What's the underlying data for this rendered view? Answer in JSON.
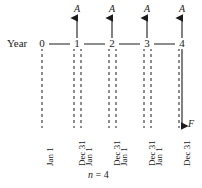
{
  "figure": {
    "type": "cash-flow-diagram",
    "axis_label": "Year",
    "periods_note_var": "n",
    "periods_note_eq": " = 4",
    "future_value_label": "F",
    "annuity_label": "A",
    "line_color": "#1a1a1a",
    "dash_color": "#1a1a1a",
    "background": "#ffffff",
    "ticks": [
      {
        "label": "0",
        "x": 42,
        "arrow_up": false,
        "date_left": null,
        "date_right": "Jan 1"
      },
      {
        "label": "1",
        "x": 77,
        "arrow_up": true,
        "date_left": "Dec 31",
        "date_right": "Jan 1"
      },
      {
        "label": "2",
        "x": 112,
        "arrow_up": true,
        "date_left": "Dec 31",
        "date_right": "Jan 1"
      },
      {
        "label": "3",
        "x": 147,
        "arrow_up": true,
        "date_left": "Dec 31",
        "date_right": "Jan 1"
      },
      {
        "label": "4",
        "x": 182,
        "arrow_up": true,
        "date_left": "Dec 31",
        "date_right": null
      }
    ],
    "cash_flows": [
      {
        "at_tick": "1",
        "label": "A",
        "direction": "up"
      },
      {
        "at_tick": "2",
        "label": "A",
        "direction": "up"
      },
      {
        "at_tick": "3",
        "label": "A",
        "direction": "up"
      },
      {
        "at_tick": "4",
        "label": "A",
        "direction": "up"
      }
    ],
    "future_flow": {
      "at_tick": "4",
      "label": "F",
      "direction": "down"
    },
    "date_labels": [
      "Jan 1",
      "Dec 31",
      "Jan 1",
      "Dec 31",
      "Jan 1",
      "Dec 31",
      "Jan 1",
      "Dec 31"
    ]
  }
}
